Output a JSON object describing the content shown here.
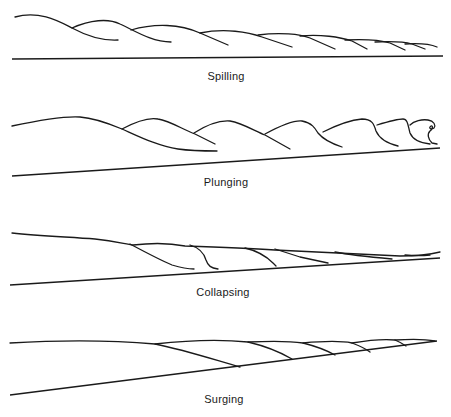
{
  "diagram": {
    "type": "breaker-types",
    "panels": [
      {
        "id": "spilling",
        "label": "Spilling",
        "label_pos": {
          "x": 226,
          "y": 71
        }
      },
      {
        "id": "plunging",
        "label": "Plunging",
        "label_pos": {
          "x": 226,
          "y": 177
        }
      },
      {
        "id": "collapsing",
        "label": "Collapsing",
        "label_pos": {
          "x": 223,
          "y": 287
        }
      },
      {
        "id": "surging",
        "label": "Surging",
        "label_pos": {
          "x": 224,
          "y": 394
        }
      }
    ],
    "stroke_color": "#1a1a1a",
    "background": "#ffffff"
  }
}
